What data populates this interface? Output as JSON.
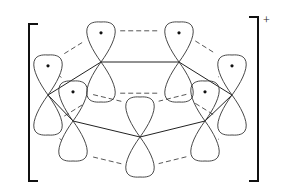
{
  "diagram": {
    "charge_label": "+",
    "colors": {
      "line": "#333333",
      "bracket": "#111111",
      "electron": "#111111",
      "background": "#ffffff"
    },
    "bracket": {
      "left": {
        "x": 10,
        "top": 16,
        "bottom": 86,
        "serif": 10
      },
      "right": {
        "x": 125,
        "top": 16,
        "bottom": 86,
        "serif": 10
      }
    },
    "atoms": [
      {
        "id": "C1",
        "x": 101,
        "y": 62,
        "electron": true
      },
      {
        "id": "C2",
        "x": 179,
        "y": 62,
        "electron": true
      },
      {
        "id": "C3",
        "x": 232,
        "y": 95,
        "electron": true
      },
      {
        "id": "C4",
        "x": 205,
        "y": 121,
        "electron": true
      },
      {
        "id": "C5",
        "x": 140,
        "y": 137,
        "electron": false
      },
      {
        "id": "C6",
        "x": 73,
        "y": 121,
        "electron": true
      },
      {
        "id": "C7",
        "x": 48,
        "y": 95,
        "electron": true
      }
    ],
    "sigma_bonds": [
      [
        "C1",
        "C2"
      ],
      [
        "C2",
        "C3"
      ],
      [
        "C3",
        "C4"
      ],
      [
        "C4",
        "C5"
      ],
      [
        "C5",
        "C6"
      ],
      [
        "C6",
        "C7"
      ],
      [
        "C7",
        "C1"
      ]
    ],
    "pi_overlaps": [
      [
        "C1",
        "C2"
      ],
      [
        "C2",
        "C3"
      ],
      [
        "C3",
        "C4"
      ],
      [
        "C4",
        "C5"
      ],
      [
        "C5",
        "C6"
      ],
      [
        "C6",
        "C7"
      ],
      [
        "C7",
        "C1"
      ]
    ]
  }
}
